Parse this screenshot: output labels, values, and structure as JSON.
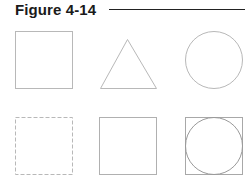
{
  "figure": {
    "title": "Figure 4-14"
  },
  "colors": {
    "stroke_light": "#b8b8b8",
    "stroke_mid": "#9a9a9a",
    "title": "#1a1a1a",
    "rule": "#222222"
  },
  "shapes": [
    {
      "id": "square",
      "row": 1,
      "col": 1,
      "type": "square",
      "style": "solid"
    },
    {
      "id": "triangle",
      "row": 1,
      "col": 2,
      "type": "triangle",
      "style": "solid"
    },
    {
      "id": "circle",
      "row": 1,
      "col": 3,
      "type": "circle",
      "style": "solid"
    },
    {
      "id": "dashed-square",
      "row": 2,
      "col": 1,
      "type": "square",
      "style": "dashed"
    },
    {
      "id": "square-2",
      "row": 2,
      "col": 2,
      "type": "square",
      "style": "solid"
    },
    {
      "id": "circle-in-square",
      "row": 2,
      "col": 3,
      "type": "circle-inscribed-in-square",
      "style": "solid"
    }
  ]
}
